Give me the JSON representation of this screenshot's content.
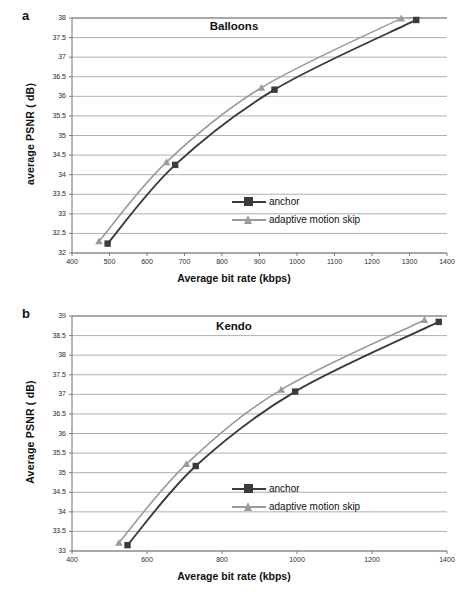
{
  "figure": {
    "caption": "",
    "series_colors": {
      "anchor": "#3b3b3b",
      "adaptive": "#9a9a9a",
      "grid": "#9c9c9c",
      "axis": "#6f6f6f"
    }
  },
  "panels": [
    {
      "letter": "a",
      "chart_data": {
        "type": "line",
        "title": "Balloons",
        "xlabel": "Average bit rate (kbps)",
        "ylabel": "average PSNR    ( dB)",
        "ylabel_main": "average PSNR",
        "ylabel_unit": "( dB)",
        "xlim": [
          400,
          1400
        ],
        "ylim": [
          32,
          38
        ],
        "xticks": [
          400,
          500,
          600,
          700,
          800,
          900,
          1000,
          1100,
          1200,
          1300,
          1400
        ],
        "yticks": [
          32,
          32.5,
          33,
          33.5,
          34,
          34.5,
          35,
          35.5,
          36,
          36.5,
          37,
          37.5,
          38
        ],
        "grid": true,
        "legend_position": "inside-right",
        "series": [
          {
            "name": "anchor",
            "marker": "square",
            "color": "#3b3b3b",
            "x": [
              495,
              675,
              940,
              1318
            ],
            "y": [
              32.24,
              34.25,
              36.17,
              37.95
            ]
          },
          {
            "name": "adaptive motion skip",
            "marker": "triangle",
            "color": "#9a9a9a",
            "x": [
              472,
              652,
              905,
              1278
            ],
            "y": [
              32.3,
              34.32,
              36.22,
              37.99
            ]
          }
        ]
      }
    },
    {
      "letter": "b",
      "chart_data": {
        "type": "line",
        "title": "Kendo",
        "xlabel": "Average bit rate (kbps)",
        "ylabel": "Average PSNR    ( dB)",
        "ylabel_main": "Average PSNR",
        "ylabel_unit": "( dB)",
        "xlim": [
          400,
          1400
        ],
        "ylim": [
          33,
          39
        ],
        "xticks": [
          400,
          600,
          800,
          1000,
          1200,
          1400
        ],
        "yticks": [
          33,
          33.5,
          34,
          34.5,
          35,
          35.5,
          36,
          36.5,
          37,
          37.5,
          38,
          38.5,
          39
        ],
        "grid": true,
        "legend_position": "inside-right",
        "series": [
          {
            "name": "anchor",
            "marker": "square",
            "color": "#3b3b3b",
            "x": [
              548,
              730,
              995,
              1378
            ],
            "y": [
              33.15,
              35.17,
              37.07,
              38.85
            ]
          },
          {
            "name": "adaptive motion skip",
            "marker": "triangle",
            "color": "#9a9a9a",
            "x": [
              525,
              705,
              958,
              1340
            ],
            "y": [
              33.21,
              35.22,
              37.12,
              38.9
            ]
          }
        ]
      }
    }
  ]
}
